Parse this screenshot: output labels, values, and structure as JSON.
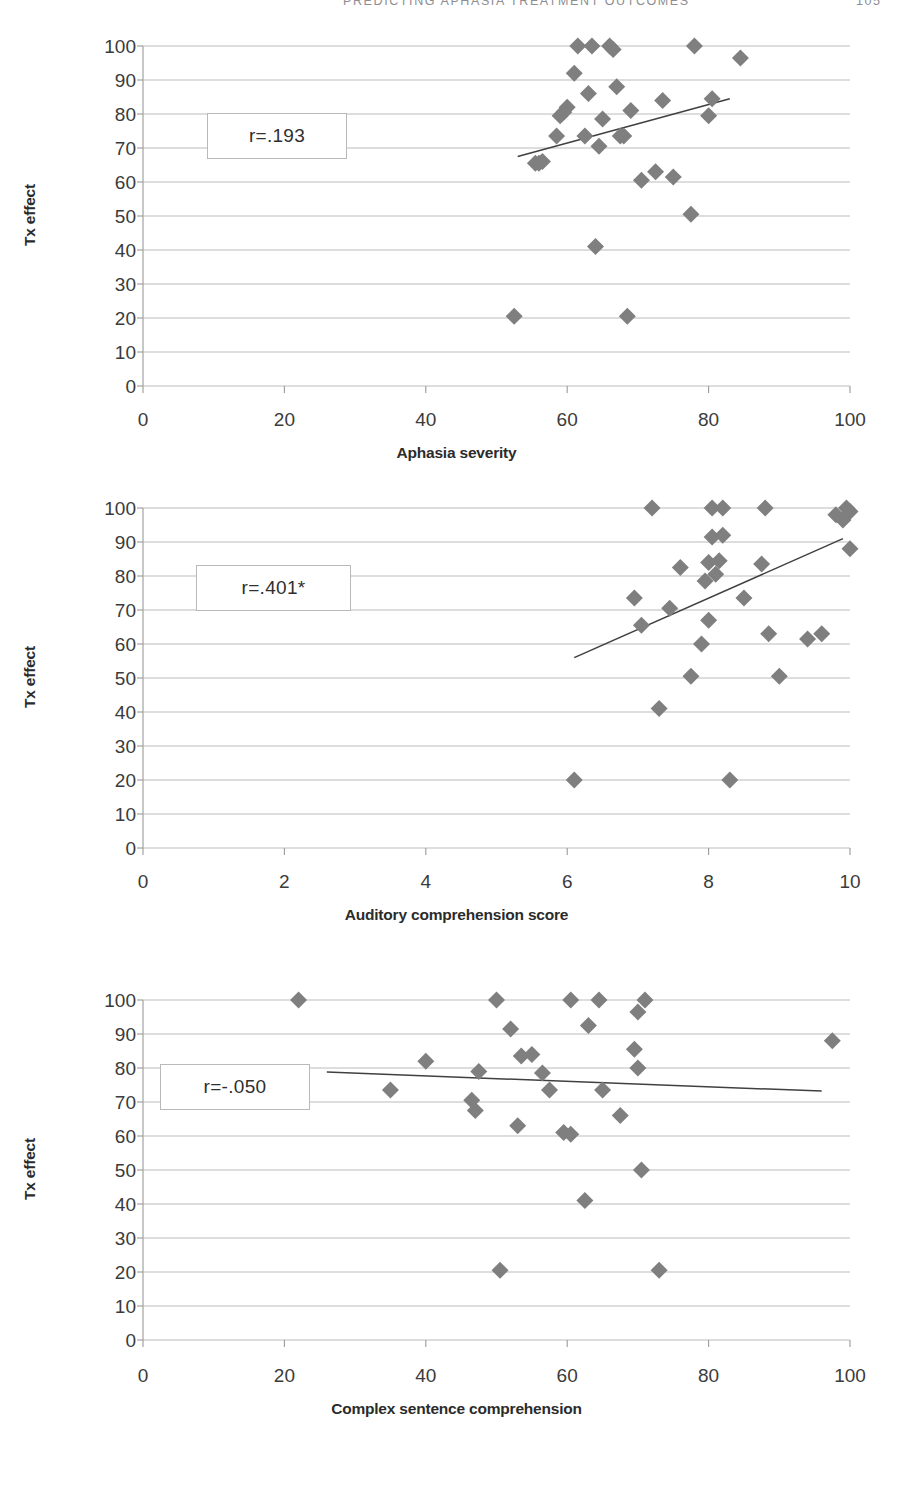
{
  "running_head": {
    "title": "PREDICTING APHASIA TREATMENT OUTCOMES",
    "page": "105"
  },
  "colors": {
    "marker": "#7f7f7f",
    "trendline": "#404040",
    "gridline": "#b3b3b3",
    "axis": "#9a9a9a",
    "text": "#3b3b3b",
    "box_border": "#b9b9b9"
  },
  "charts": [
    {
      "id": "chart-1",
      "annotation": "r=.193",
      "chart_data": {
        "type": "scatter",
        "title": "",
        "xlabel": "Aphasia severity",
        "ylabel": "Tx effect",
        "xlim": [
          0,
          100
        ],
        "ylim": [
          0,
          100
        ],
        "xticks": [
          0,
          20,
          40,
          60,
          80,
          100
        ],
        "yticks": [
          0,
          10,
          20,
          30,
          40,
          50,
          60,
          70,
          80,
          90,
          100
        ],
        "grid": "horizontal",
        "legend": "none",
        "annotations": [
          {
            "text": "r=.193",
            "x": 20,
            "y": 78
          }
        ],
        "points": [
          {
            "x": 52.5,
            "y": 20.5
          },
          {
            "x": 55.5,
            "y": 65.5
          },
          {
            "x": 56.0,
            "y": 65.5
          },
          {
            "x": 56.5,
            "y": 66.0
          },
          {
            "x": 58.5,
            "y": 73.5
          },
          {
            "x": 59.0,
            "y": 79.5
          },
          {
            "x": 59.5,
            "y": 80.5
          },
          {
            "x": 60.0,
            "y": 82.0
          },
          {
            "x": 61.0,
            "y": 92.0
          },
          {
            "x": 61.5,
            "y": 100.0
          },
          {
            "x": 62.5,
            "y": 73.5
          },
          {
            "x": 63.0,
            "y": 86.0
          },
          {
            "x": 63.5,
            "y": 100.0
          },
          {
            "x": 64.0,
            "y": 41.0
          },
          {
            "x": 64.5,
            "y": 70.5
          },
          {
            "x": 65.0,
            "y": 78.5
          },
          {
            "x": 66.0,
            "y": 100.0
          },
          {
            "x": 66.5,
            "y": 99.0
          },
          {
            "x": 67.0,
            "y": 88.0
          },
          {
            "x": 67.5,
            "y": 73.5
          },
          {
            "x": 68.0,
            "y": 73.5
          },
          {
            "x": 68.5,
            "y": 20.5
          },
          {
            "x": 69.0,
            "y": 81.0
          },
          {
            "x": 70.5,
            "y": 60.5
          },
          {
            "x": 72.5,
            "y": 63.0
          },
          {
            "x": 73.5,
            "y": 84.0
          },
          {
            "x": 75.0,
            "y": 61.5
          },
          {
            "x": 77.5,
            "y": 50.5
          },
          {
            "x": 78.0,
            "y": 100.0
          },
          {
            "x": 80.0,
            "y": 79.5
          },
          {
            "x": 80.5,
            "y": 84.5
          },
          {
            "x": 84.5,
            "y": 96.5
          }
        ],
        "trendline": {
          "x1": 53.0,
          "y1": 67.5,
          "x2": 83.0,
          "y2": 84.5
        }
      }
    },
    {
      "id": "chart-2",
      "annotation": "r=.401*",
      "chart_data": {
        "type": "scatter",
        "title": "",
        "xlabel": "Auditory comprehension score",
        "ylabel": "Tx effect",
        "xlim": [
          0,
          10
        ],
        "ylim": [
          0,
          100
        ],
        "xticks": [
          0,
          2,
          4,
          6,
          8,
          10
        ],
        "yticks": [
          0,
          10,
          20,
          30,
          40,
          50,
          60,
          70,
          80,
          90,
          100
        ],
        "grid": "horizontal",
        "legend": "none",
        "annotations": [
          {
            "text": "r=.401*",
            "x": 2.0,
            "y": 78
          }
        ],
        "points": [
          {
            "x": 6.1,
            "y": 20.0
          },
          {
            "x": 6.95,
            "y": 73.5
          },
          {
            "x": 7.05,
            "y": 65.5
          },
          {
            "x": 7.2,
            "y": 100.0
          },
          {
            "x": 7.3,
            "y": 41.0
          },
          {
            "x": 7.45,
            "y": 70.5
          },
          {
            "x": 7.6,
            "y": 82.5
          },
          {
            "x": 7.75,
            "y": 50.5
          },
          {
            "x": 7.9,
            "y": 60.0
          },
          {
            "x": 7.95,
            "y": 78.5
          },
          {
            "x": 8.0,
            "y": 67.0
          },
          {
            "x": 8.0,
            "y": 84.0
          },
          {
            "x": 8.05,
            "y": 100.0
          },
          {
            "x": 8.05,
            "y": 91.5
          },
          {
            "x": 8.1,
            "y": 80.5
          },
          {
            "x": 8.15,
            "y": 84.5
          },
          {
            "x": 8.2,
            "y": 100.0
          },
          {
            "x": 8.2,
            "y": 92.0
          },
          {
            "x": 8.3,
            "y": 20.0
          },
          {
            "x": 8.5,
            "y": 73.5
          },
          {
            "x": 8.75,
            "y": 83.5
          },
          {
            "x": 8.8,
            "y": 100.0
          },
          {
            "x": 8.85,
            "y": 63.0
          },
          {
            "x": 9.0,
            "y": 50.5
          },
          {
            "x": 9.4,
            "y": 61.5
          },
          {
            "x": 9.6,
            "y": 63.0
          },
          {
            "x": 9.8,
            "y": 98.0
          },
          {
            "x": 9.9,
            "y": 96.5
          },
          {
            "x": 9.95,
            "y": 100.0
          },
          {
            "x": 10.0,
            "y": 88.0
          },
          {
            "x": 10.0,
            "y": 99.0
          }
        ],
        "trendline": {
          "x1": 6.1,
          "y1": 56.0,
          "x2": 9.9,
          "y2": 91.0
        }
      }
    },
    {
      "id": "chart-3",
      "annotation": "r=-.050",
      "chart_data": {
        "type": "scatter",
        "title": "",
        "xlabel": "Complex sentence comprehension",
        "ylabel": "Tx effect",
        "xlim": [
          0,
          100
        ],
        "ylim": [
          0,
          100
        ],
        "xticks": [
          0,
          20,
          40,
          60,
          80,
          100
        ],
        "yticks": [
          0,
          10,
          20,
          30,
          40,
          50,
          60,
          70,
          80,
          90,
          100
        ],
        "grid": "horizontal",
        "legend": "none",
        "annotations": [
          {
            "text": "r=-.050",
            "x": 14,
            "y": 75
          }
        ],
        "points": [
          {
            "x": 22.0,
            "y": 100.0
          },
          {
            "x": 35.0,
            "y": 73.5
          },
          {
            "x": 40.0,
            "y": 82.0
          },
          {
            "x": 46.5,
            "y": 70.5
          },
          {
            "x": 47.0,
            "y": 67.5
          },
          {
            "x": 47.5,
            "y": 79.0
          },
          {
            "x": 50.0,
            "y": 100.0
          },
          {
            "x": 50.5,
            "y": 20.5
          },
          {
            "x": 52.0,
            "y": 91.5
          },
          {
            "x": 53.0,
            "y": 63.0
          },
          {
            "x": 53.5,
            "y": 83.5
          },
          {
            "x": 55.0,
            "y": 84.0
          },
          {
            "x": 56.5,
            "y": 78.5
          },
          {
            "x": 57.5,
            "y": 73.5
          },
          {
            "x": 59.5,
            "y": 61.0
          },
          {
            "x": 60.5,
            "y": 60.5
          },
          {
            "x": 60.5,
            "y": 100.0
          },
          {
            "x": 62.5,
            "y": 41.0
          },
          {
            "x": 63.0,
            "y": 92.5
          },
          {
            "x": 64.5,
            "y": 100.0
          },
          {
            "x": 65.0,
            "y": 73.5
          },
          {
            "x": 67.5,
            "y": 66.0
          },
          {
            "x": 69.5,
            "y": 85.5
          },
          {
            "x": 70.0,
            "y": 80.0
          },
          {
            "x": 70.0,
            "y": 96.5
          },
          {
            "x": 70.5,
            "y": 50.0
          },
          {
            "x": 71.0,
            "y": 100.0
          },
          {
            "x": 73.0,
            "y": 20.5
          },
          {
            "x": 97.5,
            "y": 88.0
          }
        ],
        "trendline": {
          "x1": 26.0,
          "y1": 78.8,
          "x2": 96.0,
          "y2": 73.2
        }
      }
    }
  ]
}
